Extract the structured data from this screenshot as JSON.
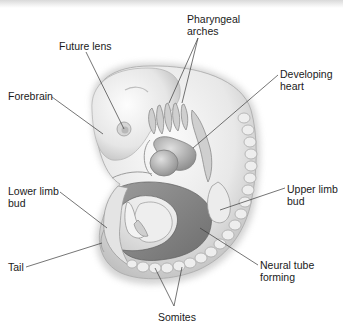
{
  "diagram": {
    "labels": [
      {
        "id": "pharyngeal-arches",
        "lines": [
          "Pharyngeal",
          "arches"
        ]
      },
      {
        "id": "future-lens",
        "lines": [
          "Future lens"
        ]
      },
      {
        "id": "forebrain",
        "lines": [
          "Forebrain"
        ]
      },
      {
        "id": "developing-heart",
        "lines": [
          "Developing",
          "heart"
        ]
      },
      {
        "id": "lower-limb-bud",
        "lines": [
          "Lower limb",
          "bud"
        ]
      },
      {
        "id": "upper-limb-bud",
        "lines": [
          "Upper limb",
          "bud"
        ]
      },
      {
        "id": "tail",
        "lines": [
          "Tail"
        ]
      },
      {
        "id": "neural-tube-forming",
        "lines": [
          "Neural tube",
          "forming"
        ]
      },
      {
        "id": "somites",
        "lines": [
          "Somites"
        ]
      }
    ],
    "colors": {
      "background": "#ffffff",
      "leader_line": "#3a3a3a",
      "embryo_light": "#f2f2f2",
      "embryo_mid": "#c8c8c8",
      "embryo_dark": "#7a7a7a",
      "text": "#1a1a1a"
    }
  }
}
